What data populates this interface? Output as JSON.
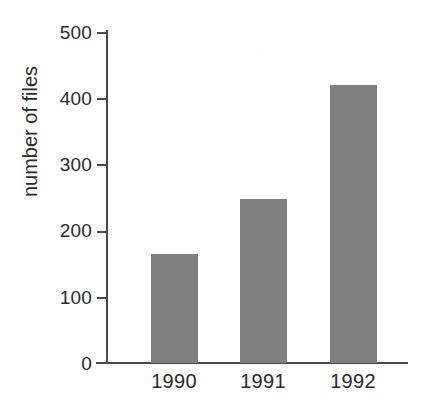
{
  "chart_data": {
    "type": "bar",
    "title": "",
    "categories": [
      "1990",
      "1991",
      "1992"
    ],
    "values": [
      165,
      248,
      420
    ],
    "xlabel": "",
    "ylabel": "number of files",
    "ylim": [
      0,
      500
    ],
    "yticks": [
      0,
      100,
      200,
      300,
      400,
      500
    ],
    "ytick_labels": [
      "0",
      "100",
      "200",
      "300",
      "400",
      "500"
    ],
    "grid": false,
    "legend": false,
    "bar_color": "#808080",
    "axis_color": "#4a4a4a",
    "background_color": "#fefefe"
  },
  "axes": {
    "y_title": "number of files",
    "y_tick_labels": [
      "500",
      "400",
      "300",
      "200",
      "100",
      "0"
    ],
    "x_tick_labels": [
      "1990",
      "1991",
      "1992"
    ]
  }
}
